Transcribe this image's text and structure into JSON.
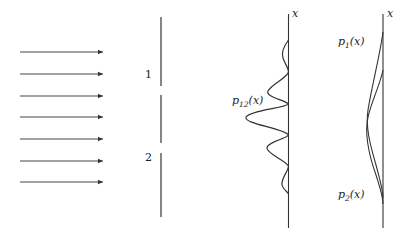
{
  "figure": {
    "type": "double-slit interference diagram",
    "incident_waves": {
      "count": 7,
      "direction": "right"
    },
    "barrier": {
      "slits": [
        {
          "label": "1"
        },
        {
          "label": "2"
        }
      ]
    },
    "middle_screen": {
      "axis_label": "x",
      "curve_label": {
        "base": "p",
        "subscript": "12",
        "arg": "(x)"
      }
    },
    "right_screen": {
      "axis_label": "x",
      "curves": [
        {
          "base": "p",
          "subscript": "1",
          "arg": "(x)"
        },
        {
          "base": "p",
          "subscript": "2",
          "arg": "(x)"
        }
      ]
    },
    "colors": {
      "line": "#3a3a3a",
      "background": "#ffffff"
    }
  }
}
